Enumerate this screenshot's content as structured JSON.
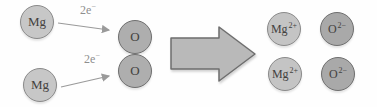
{
  "colors": {
    "background": "#fefefe",
    "mg_atom_fill": "#c7c7c7",
    "o_atom_fill": "#aeaeae",
    "mg_ion_fill": "#c4c4c4",
    "o_ion_fill": "#a9a9a9",
    "light_circle_border": "#8a8a8a",
    "dark_circle_border": "#6f6f6f",
    "big_arrow_fill": "#b9b9b9",
    "big_arrow_border": "#6e6e6e",
    "thin_arrow": "#9a9a9a",
    "label_text": "#43413e",
    "electron_label_text": "#8e8e8e"
  },
  "reactants": {
    "mg_atoms": [
      {
        "label": "Mg"
      },
      {
        "label": "Mg"
      }
    ],
    "o_atoms": [
      {
        "label": "O"
      },
      {
        "label": "O"
      }
    ],
    "electron_transfers": [
      {
        "label": "2e",
        "sup": "−"
      },
      {
        "label": "2e",
        "sup": "−"
      }
    ]
  },
  "products": {
    "ions": [
      {
        "base": "Mg",
        "sup": "2+"
      },
      {
        "base": "O",
        "sup": "2−"
      },
      {
        "base": "Mg",
        "sup": "2+"
      },
      {
        "base": "O",
        "sup": "2−"
      }
    ]
  }
}
